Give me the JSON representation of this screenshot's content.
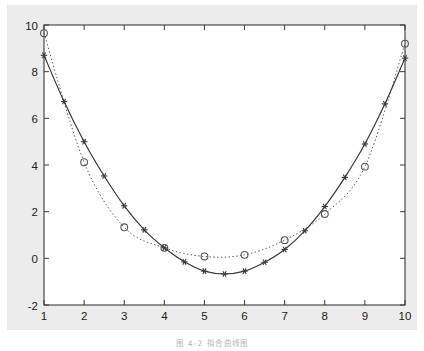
{
  "figure": {
    "caption": "图 4-2  拟合曲线图",
    "background_color": "#ececec",
    "axes_color": "#3a3a3a",
    "plot_background": "#ffffff"
  },
  "chart_data": {
    "type": "line",
    "title": "",
    "xlabel": "",
    "ylabel": "",
    "xlim": [
      1,
      10
    ],
    "ylim": [
      -2,
      10
    ],
    "xticks": [
      1,
      2,
      3,
      4,
      5,
      6,
      7,
      8,
      9,
      10
    ],
    "yticks": [
      -2,
      0,
      2,
      4,
      6,
      8,
      10
    ],
    "xtick_labels": [
      "1",
      "2",
      "3",
      "4",
      "5",
      "6",
      "7",
      "8",
      "9",
      "10"
    ],
    "ytick_labels": [
      "-2",
      "0",
      "2",
      "4",
      "6",
      "8",
      "10"
    ],
    "grid": false,
    "legend": null,
    "series": [
      {
        "name": "measured-data",
        "marker": "circle",
        "linestyle": "dotted",
        "color": "#555555",
        "x": [
          1,
          2,
          3,
          4,
          5,
          6,
          7,
          8,
          9,
          10
        ],
        "values": [
          9.65,
          4.12,
          1.33,
          0.45,
          0.08,
          0.15,
          0.78,
          1.9,
          3.93,
          9.2
        ]
      },
      {
        "name": "fitted-curve",
        "marker": "asterisk",
        "linestyle": "solid",
        "color": "#3a3a3a",
        "x": [
          1,
          1.5,
          2,
          2.5,
          3,
          3.5,
          4,
          4.5,
          5,
          5.5,
          6,
          6.5,
          7,
          7.5,
          8,
          8.5,
          9,
          9.5,
          10
        ],
        "values": [
          8.7,
          6.72,
          5.0,
          3.53,
          2.25,
          1.22,
          0.45,
          -0.15,
          -0.55,
          -0.67,
          -0.55,
          -0.17,
          0.38,
          1.18,
          2.22,
          3.47,
          4.9,
          6.62,
          8.58
        ]
      }
    ]
  }
}
